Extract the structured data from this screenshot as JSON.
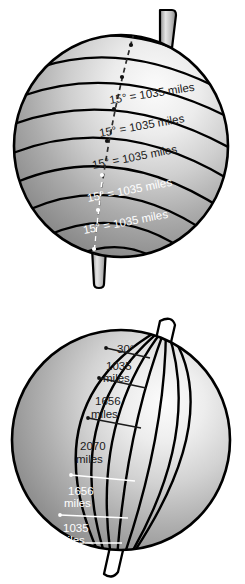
{
  "figure": {
    "kind": "two-globe-diagram",
    "background_color": "#ffffff",
    "line_color": "#000000",
    "dark_text_color": "#1a1a1a",
    "light_text_color": "#ffffff",
    "sphere_shade_light": "#f2f2f2",
    "sphere_shade_mid": "#b8b8b8",
    "sphere_shade_dark": "#6f6f6f",
    "axis_rod_color": "#c9c9c9"
  },
  "top_globe": {
    "name": "latitude-globe",
    "description": "Sphere with horizontal latitude bands and a dashed meridian arc marked with tick points",
    "axis": {
      "top_pole_label": "axis-rod-top",
      "bottom_pole_label": "axis-rod-bottom"
    },
    "band_count": 9,
    "tick_count": 6,
    "labels": [
      {
        "id": "lat-label-1",
        "text": "15° = 1035 miles",
        "color": "dark"
      },
      {
        "id": "lat-label-2",
        "text": "15° = 1035 miles",
        "color": "dark"
      },
      {
        "id": "lat-label-3",
        "text": "15° = 1035 miles",
        "color": "dark"
      },
      {
        "id": "lat-label-4",
        "text": "15° = 1035 miles",
        "color": "light"
      },
      {
        "id": "lat-label-5",
        "text": "15° = 1035 miles",
        "color": "light"
      }
    ]
  },
  "bottom_globe": {
    "name": "longitude-globe",
    "description": "Sphere with converging longitude meridians, a prime-meridian rod through the poles, and spacing labels along a latitude ladder",
    "axis": {
      "top_pole_label": "axis-rod-top",
      "bottom_pole_label": "axis-rod-bottom"
    },
    "meridian_count": 7,
    "angle_label": {
      "id": "lon-angle-label",
      "text": "30°",
      "color": "dark"
    },
    "labels": [
      {
        "id": "lon-label-1",
        "line1": "1035",
        "line2": "miles",
        "color": "dark"
      },
      {
        "id": "lon-label-2",
        "line1": "1656",
        "line2": "miles",
        "color": "dark"
      },
      {
        "id": "lon-label-3",
        "line1": "2070",
        "line2": "miles",
        "color": "dark"
      },
      {
        "id": "lon-label-4",
        "line1": "1656",
        "line2": "miles",
        "color": "light"
      },
      {
        "id": "lon-label-5",
        "line1": "1035",
        "line2": "miles",
        "color": "light"
      }
    ]
  }
}
